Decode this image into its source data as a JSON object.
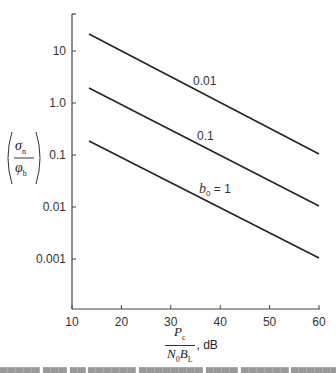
{
  "chart_data": {
    "type": "line",
    "title": "",
    "xlabel": "P_c / (N_0 B_L), dB",
    "ylabel": "(σ_n / φ_b)",
    "x_ticks": [
      "10",
      "20",
      "30",
      "40",
      "50",
      "60"
    ],
    "y_ticks": [
      "10",
      "1.0",
      "0.1",
      "0.01",
      "0.001"
    ],
    "y_scale": "log",
    "xlim": [
      10,
      60
    ],
    "ylim": [
      0.0001,
      100
    ],
    "grid": false,
    "legend": "inline labels",
    "series": [
      {
        "name": "0.01",
        "x": [
          14,
          60
        ],
        "y": [
          20,
          0.1
        ]
      },
      {
        "name": "0.1",
        "x": [
          14,
          60
        ],
        "y": [
          1.9,
          0.01
        ]
      },
      {
        "name": "b0 = 1",
        "x": [
          14,
          60
        ],
        "y": [
          0.18,
          0.001
        ]
      }
    ]
  },
  "axes": {
    "x_ticks": [
      {
        "label": "10",
        "value": 10
      },
      {
        "label": "20",
        "value": 20
      },
      {
        "label": "30",
        "value": 30
      },
      {
        "label": "40",
        "value": 40
      },
      {
        "label": "50",
        "value": 50
      },
      {
        "label": "60",
        "value": 60
      }
    ],
    "y_ticks": [
      {
        "label": "10",
        "exp": 1
      },
      {
        "label": "1.0",
        "exp": 0
      },
      {
        "label": "0.1",
        "exp": -1
      },
      {
        "label": "0.01",
        "exp": -2
      },
      {
        "label": "0.001",
        "exp": -3
      }
    ],
    "ylabel": {
      "num": "σ",
      "num_sub": "n",
      "den": "φ",
      "den_sub": "b"
    },
    "xlabel": {
      "num": "P",
      "num_sub": "c",
      "den1": "N",
      "den1_sub": "0",
      "den2": "B",
      "den2_sub": "L",
      "unit": ", dB"
    }
  },
  "curve_labels": [
    {
      "text": "0.01"
    },
    {
      "text": "0.1"
    },
    {
      "text_b": "b",
      "text_sub": "0",
      "text_rest": " = 1"
    }
  ]
}
